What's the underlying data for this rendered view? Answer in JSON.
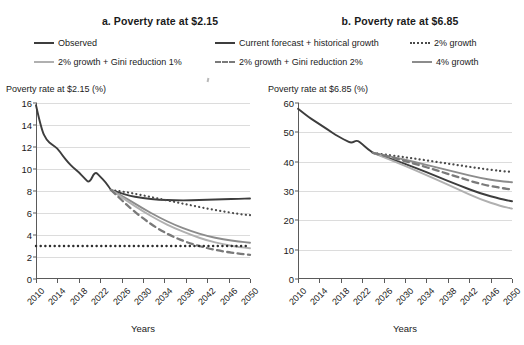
{
  "figure": {
    "panel_a_title": "a. Poverty rate at $2.15",
    "panel_b_title": "b. Poverty rate at $6.85"
  },
  "legend": {
    "items": [
      {
        "label": "Observed",
        "style": "solid",
        "color": "#3d3d3d"
      },
      {
        "label": "Current forecast + historical growth",
        "style": "solid",
        "color": "#3d3d3d"
      },
      {
        "label": "2% growth",
        "style": "dotted",
        "color": "#4a4a4a"
      },
      {
        "label": "2% growth + Gini reduction 1%",
        "style": "solid",
        "color": "#b0b0b0"
      },
      {
        "label": "2% growth + Gini reduction 2%",
        "style": "dashed",
        "color": "#7a7a7a"
      },
      {
        "label": "4% growth",
        "style": "solid",
        "color": "#8c8c8c"
      }
    ]
  },
  "axis": {
    "x_label_a": "Years",
    "x_label_b": "Years",
    "y_label_a": "Poverty rate at $2.15 (%)",
    "y_label_b": "Poverty rate at $6.85 (%)"
  },
  "chart_data": [
    {
      "type": "line",
      "title": "a. Poverty rate at $2.15",
      "xlabel": "Years",
      "ylabel": "Poverty rate at $2.15 (%)",
      "xlim": [
        2010,
        2050
      ],
      "ylim": [
        0,
        16
      ],
      "yticks": [
        0,
        2,
        4,
        6,
        8,
        10,
        12,
        14,
        16
      ],
      "xticks": [
        2010,
        2014,
        2018,
        2022,
        2026,
        2030,
        2034,
        2038,
        2042,
        2046,
        2050
      ],
      "grid": true,
      "legend_position": "top",
      "series": [
        {
          "name": "Observed",
          "style": "solid",
          "color": "#3d3d3d",
          "width": 1.9,
          "x": [
            2010,
            2011,
            2012,
            2013,
            2014,
            2015,
            2016,
            2017,
            2018,
            2019,
            2020,
            2021,
            2022,
            2023,
            2024
          ],
          "values": [
            15.8,
            13.6,
            12.6,
            12.2,
            11.9,
            11.2,
            10.6,
            10.1,
            9.7,
            9.2,
            8.7,
            9.8,
            9.3,
            8.8,
            8.1
          ]
        },
        {
          "name": "Current forecast + historical growth",
          "style": "solid",
          "color": "#3d3d3d",
          "width": 1.9,
          "x": [
            2024,
            2027,
            2030,
            2033,
            2036,
            2039,
            2042,
            2045,
            2048,
            2050
          ],
          "values": [
            8.1,
            7.6,
            7.35,
            7.2,
            7.15,
            7.15,
            7.2,
            7.25,
            7.3,
            7.32
          ]
        },
        {
          "name": "2% growth",
          "style": "dotted",
          "color": "#4a4a4a",
          "width": 2.2,
          "x": [
            2024,
            2027,
            2030,
            2033,
            2036,
            2039,
            2042,
            2045,
            2048,
            2050
          ],
          "values": [
            8.1,
            7.9,
            7.6,
            7.3,
            7.0,
            6.7,
            6.4,
            6.15,
            5.9,
            5.8
          ]
        },
        {
          "name": "4% growth",
          "style": "solid",
          "color": "#8c8c8c",
          "width": 1.9,
          "x": [
            2024,
            2027,
            2030,
            2033,
            2036,
            2039,
            2042,
            2045,
            2048,
            2050
          ],
          "values": [
            8.1,
            7.3,
            6.4,
            5.6,
            4.9,
            4.35,
            3.9,
            3.6,
            3.4,
            3.3
          ]
        },
        {
          "name": "2% growth + Gini reduction 1%",
          "style": "solid",
          "color": "#b0b0b0",
          "width": 1.9,
          "x": [
            2024,
            2027,
            2030,
            2033,
            2036,
            2039,
            2042,
            2045,
            2048,
            2050
          ],
          "values": [
            8.1,
            7.1,
            6.15,
            5.3,
            4.6,
            4.0,
            3.5,
            3.15,
            2.9,
            2.8
          ]
        },
        {
          "name": "2% growth + Gini reduction 2%",
          "style": "dashed",
          "color": "#7a7a7a",
          "width": 2.3,
          "x": [
            2024,
            2027,
            2030,
            2033,
            2036,
            2039,
            2042,
            2045,
            2048,
            2050
          ],
          "values": [
            8.1,
            6.7,
            5.5,
            4.5,
            3.75,
            3.2,
            2.8,
            2.5,
            2.3,
            2.2
          ]
        },
        {
          "name": "reference line at 3%",
          "style": "dotted",
          "color": "#2e2e2e",
          "width": 2.4,
          "x": [
            2010,
            2050
          ],
          "values": [
            3.0,
            3.0
          ]
        }
      ]
    },
    {
      "type": "line",
      "title": "b. Poverty rate at $6.85",
      "xlabel": "Years",
      "ylabel": "Poverty rate at $6.85 (%)",
      "xlim": [
        2010,
        2050
      ],
      "ylim": [
        0,
        60
      ],
      "yticks": [
        0,
        10,
        20,
        30,
        40,
        50,
        60
      ],
      "xticks": [
        2010,
        2014,
        2018,
        2022,
        2026,
        2030,
        2034,
        2038,
        2042,
        2046,
        2050
      ],
      "grid": true,
      "legend_position": "top",
      "series": [
        {
          "name": "Observed",
          "style": "solid",
          "color": "#3d3d3d",
          "width": 1.9,
          "x": [
            2010,
            2011,
            2012,
            2013,
            2014,
            2015,
            2016,
            2017,
            2018,
            2019,
            2020,
            2021,
            2022,
            2023,
            2024
          ],
          "values": [
            58.0,
            56.6,
            55.2,
            54.0,
            52.8,
            51.6,
            50.4,
            49.2,
            48.1,
            47.2,
            46.3,
            47.4,
            46.0,
            44.4,
            43.0
          ]
        },
        {
          "name": "Current forecast + historical growth",
          "style": "solid",
          "color": "#3d3d3d",
          "width": 1.9,
          "x": [
            2024,
            2028,
            2032,
            2036,
            2040,
            2044,
            2048,
            2050
          ],
          "values": [
            43.0,
            40.6,
            37.9,
            34.9,
            32.0,
            29.2,
            27.2,
            26.5
          ]
        },
        {
          "name": "2% growth",
          "style": "dotted",
          "color": "#4a4a4a",
          "width": 2.2,
          "x": [
            2024,
            2028,
            2032,
            2036,
            2040,
            2044,
            2048,
            2050
          ],
          "values": [
            43.0,
            42.0,
            41.0,
            39.9,
            38.8,
            37.7,
            36.8,
            36.5
          ]
        },
        {
          "name": "4% growth",
          "style": "solid",
          "color": "#8c8c8c",
          "width": 1.9,
          "x": [
            2024,
            2028,
            2032,
            2036,
            2040,
            2044,
            2048,
            2050
          ],
          "values": [
            43.0,
            41.5,
            39.8,
            38.0,
            36.2,
            34.4,
            33.3,
            33.0
          ]
        },
        {
          "name": "2% growth + Gini reduction 1%",
          "style": "solid",
          "color": "#b0b0b0",
          "width": 1.9,
          "x": [
            2024,
            2028,
            2032,
            2036,
            2040,
            2044,
            2048,
            2050
          ],
          "values": [
            43.0,
            40.1,
            37.0,
            33.8,
            30.5,
            27.2,
            24.8,
            24.0
          ]
        },
        {
          "name": "2% growth + Gini reduction 2%",
          "style": "dashed",
          "color": "#7a7a7a",
          "width": 2.3,
          "x": [
            2024,
            2028,
            2032,
            2036,
            2040,
            2044,
            2048,
            2050
          ],
          "values": [
            43.0,
            41.2,
            39.2,
            37.0,
            34.7,
            32.4,
            31.0,
            30.5
          ]
        }
      ]
    }
  ]
}
